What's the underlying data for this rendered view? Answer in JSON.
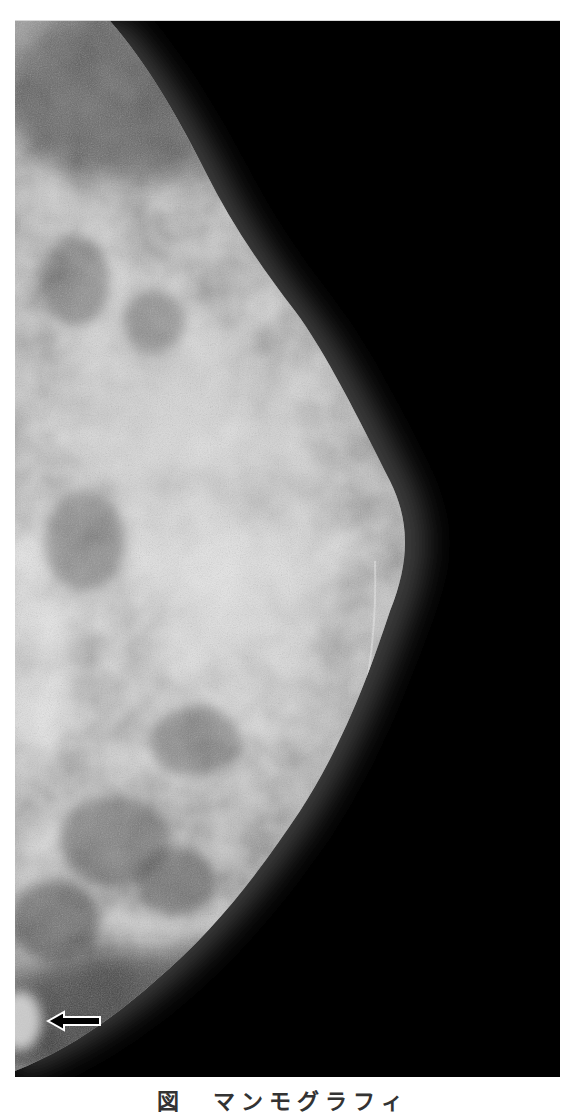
{
  "figure": {
    "type": "mammogram",
    "view": "right breast, lateral projection",
    "background_color": "#000000",
    "tissue_color": "#bdbdbd",
    "annotation": {
      "arrow": {
        "icon": "left-arrow-icon",
        "direction": "left",
        "fill": "#000000",
        "stroke": "#ffffff"
      }
    }
  },
  "caption": {
    "text": "図　マンモグラフィ"
  }
}
